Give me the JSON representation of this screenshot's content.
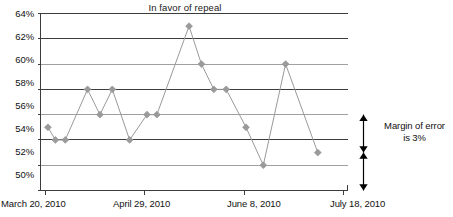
{
  "chart_data": {
    "type": "line",
    "title": "In favor of repeal",
    "xlabel": "",
    "ylabel": "",
    "ylim": [
      50,
      64
    ],
    "ytick_labels": [
      "64%",
      "62%",
      "60%",
      "58%",
      "56%",
      "54%",
      "52%",
      "50%"
    ],
    "ytick_values": [
      64,
      62,
      60,
      58,
      56,
      54,
      52,
      50
    ],
    "xtick_labels": [
      "March 20, 2010",
      "April 29, 2010",
      "June 8, 2010",
      "July 18, 2010"
    ],
    "xtick_values": [
      0,
      40,
      80,
      120
    ],
    "xlim": [
      -2,
      122
    ],
    "grid": true,
    "legend": false,
    "series": [
      {
        "name": "In favor of repeal",
        "color": "#9a9a9a",
        "marker": "diamond",
        "x": [
          1,
          4,
          8,
          17,
          22,
          27,
          34,
          41,
          45,
          58,
          63,
          68,
          73,
          81,
          88,
          97,
          110
        ],
        "values": [
          55,
          54,
          54,
          58,
          56,
          58,
          54,
          56,
          56,
          63,
          60,
          58,
          58,
          55,
          52,
          60,
          53
        ]
      }
    ],
    "annotations": [
      {
        "name": "margin-of-error",
        "text_line1": "Margin of error",
        "text_line2": "is 3%",
        "arrow_spans": [
          [
            56,
            53
          ],
          [
            53,
            50
          ]
        ]
      }
    ]
  },
  "colors": {
    "series_line": "#9a9a9a",
    "grid_dark": "#3c3c3c",
    "grid_light": "#a0a0a0",
    "axis": "#3c3c3c",
    "text": "#111111",
    "arrow": "#000000"
  }
}
